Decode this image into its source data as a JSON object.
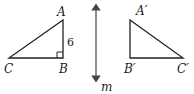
{
  "diagram": {
    "type": "reflection",
    "line_of_reflection": {
      "label": "m",
      "x": 96,
      "y1": 4,
      "y2": 82
    },
    "original_triangle": {
      "vertices": {
        "A": {
          "label": "A",
          "x": 63,
          "y": 20
        },
        "B": {
          "label": "B",
          "x": 63,
          "y": 58
        },
        "C": {
          "label": "C",
          "x": 9,
          "y": 58
        }
      },
      "right_angle_at": "B",
      "side_AB_length": "6"
    },
    "image_triangle": {
      "vertices": {
        "A": {
          "label": "A′",
          "x": 130,
          "y": 20
        },
        "B": {
          "label": "B′",
          "x": 130,
          "y": 58
        },
        "C": {
          "label": "C′",
          "x": 183,
          "y": 58
        }
      }
    },
    "colors": {
      "stroke": "#222222",
      "line_m": "#444444"
    }
  }
}
